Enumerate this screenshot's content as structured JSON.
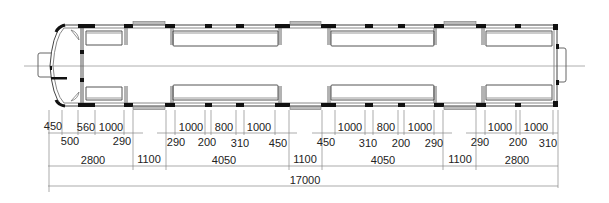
{
  "diagram": {
    "type": "railcar floor plan with dimensions",
    "colors": {
      "wall": "#111111",
      "line": "#777777",
      "window": "#999999",
      "text": "#222222"
    }
  },
  "dimensions": {
    "row1_top": [
      {
        "label": "450",
        "x": 53
      },
      {
        "label": "560",
        "x": 82
      },
      {
        "label": "1000",
        "x": 111
      },
      {
        "label": "1000",
        "x": 193
      },
      {
        "label": "800",
        "x": 225
      },
      {
        "label": "1000",
        "x": 259
      },
      {
        "label": "1000",
        "x": 349
      },
      {
        "label": "800",
        "x": 386
      },
      {
        "label": "1000",
        "x": 420
      },
      {
        "label": "1000",
        "x": 502
      },
      {
        "label": "1000",
        "x": 535
      }
    ],
    "row2": [
      {
        "label": "500",
        "x": 70
      },
      {
        "label": "290",
        "x": 122
      },
      {
        "label": "290",
        "x": 176
      },
      {
        "label": "200",
        "x": 207
      },
      {
        "label": "310",
        "x": 240
      },
      {
        "label": "450",
        "x": 278
      },
      {
        "label": "450",
        "x": 326
      },
      {
        "label": "310",
        "x": 368
      },
      {
        "label": "200",
        "x": 401
      },
      {
        "label": "290",
        "x": 434
      },
      {
        "label": "290",
        "x": 480
      },
      {
        "label": "200",
        "x": 519
      },
      {
        "label": "310",
        "x": 548
      }
    ],
    "row3_sections": [
      {
        "label": "2800",
        "x": 93
      },
      {
        "label": "1100",
        "x": 149
      },
      {
        "label": "4050",
        "x": 226
      },
      {
        "label": "1100",
        "x": 306
      },
      {
        "label": "4050",
        "x": 383
      },
      {
        "label": "1100",
        "x": 461
      },
      {
        "label": "2800",
        "x": 517
      }
    ],
    "total": {
      "label": "17000",
      "x": 305
    }
  }
}
